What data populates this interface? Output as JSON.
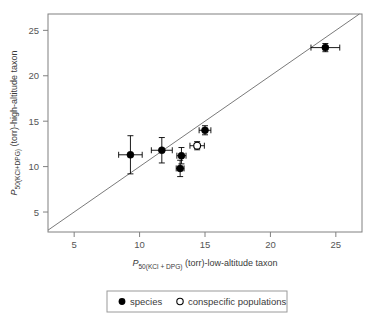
{
  "chart_data": {
    "type": "scatter",
    "title": "",
    "xlabel_parts": {
      "p": "P",
      "sub": "50(KCl + DPG)",
      "rest": " (torr)-low-altitude taxon"
    },
    "ylabel_parts": {
      "p": "P",
      "sub": "50(KCl+DPG)",
      "rest": " (torr)-high-altitude taxon"
    },
    "xlabel": "P50(KCl + DPG) (torr)-low-altitude taxon",
    "ylabel": "P50(KCl+DPG) (torr)-high-altitude taxon",
    "xlim": [
      3.0,
      27.0
    ],
    "ylim": [
      2.8,
      26.8
    ],
    "xticks": [
      5,
      10,
      15,
      20,
      25
    ],
    "yticks": [
      5,
      10,
      15,
      20,
      25
    ],
    "xtick_labels": [
      "5",
      "10",
      "15",
      "20",
      "25"
    ],
    "ytick_labels": [
      "5",
      "10",
      "15",
      "20",
      "25"
    ],
    "grid": false,
    "reference_line": {
      "name": "identity-line",
      "type": "y=x",
      "from": [
        3.0,
        3.0
      ],
      "to": [
        26.8,
        26.8
      ]
    },
    "series": [
      {
        "name": "species",
        "marker": "filled-circle",
        "color": "#000000",
        "points": [
          {
            "x": 9.3,
            "y": 11.3,
            "xerr": 0.9,
            "yerr": 2.1
          },
          {
            "x": 11.7,
            "y": 11.8,
            "xerr": 0.8,
            "yerr": 1.4
          },
          {
            "x": 13.2,
            "y": 11.2,
            "xerr": 0.35,
            "yerr": 0.9
          },
          {
            "x": 13.1,
            "y": 9.8,
            "xerr": 0.3,
            "yerr": 0.9
          },
          {
            "x": 15.0,
            "y": 14.0,
            "xerr": 0.45,
            "yerr": 0.5
          },
          {
            "x": 24.2,
            "y": 23.1,
            "xerr": 1.1,
            "yerr": 0.45
          }
        ]
      },
      {
        "name": "conspecific populations",
        "marker": "open-circle",
        "color": "#000000",
        "points": [
          {
            "x": 14.4,
            "y": 12.3,
            "xerr": 0.55,
            "yerr": 0.45
          }
        ]
      }
    ],
    "legend": {
      "position": "below-axes",
      "entries": [
        {
          "marker": "filled-circle",
          "label": "species"
        },
        {
          "marker": "open-circle",
          "label": "conspecific populations"
        }
      ]
    }
  }
}
